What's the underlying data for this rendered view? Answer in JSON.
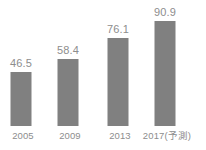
{
  "chart_data": {
    "type": "bar",
    "title": "",
    "subtitle": "",
    "xlabel": "",
    "ylabel": "",
    "grid": false,
    "legend": false,
    "ylim": [
      0,
      100
    ],
    "categories": [
      "2005",
      "2009",
      "2013",
      "2017(予測)"
    ],
    "values": [
      46.5,
      58.4,
      76.1,
      90.9
    ],
    "value_labels": [
      "46.5",
      "58.4",
      "76.1",
      "90.9"
    ],
    "series": [
      {
        "name": "",
        "values": [
          46.5,
          58.4,
          76.1,
          90.9
        ]
      }
    ]
  },
  "style": {
    "bar_color": "#808080",
    "label_color": "#8d8d8d",
    "background": "#ffffff"
  },
  "bars": [
    {
      "category": "2005",
      "value_label": "46.5",
      "value": 46.5
    },
    {
      "category": "2009",
      "value_label": "58.4",
      "value": 58.4
    },
    {
      "category": "2013",
      "value_label": "76.1",
      "value": 76.1
    },
    {
      "category": "2017(予測)",
      "value_label": "90.9",
      "value": 90.9
    }
  ]
}
